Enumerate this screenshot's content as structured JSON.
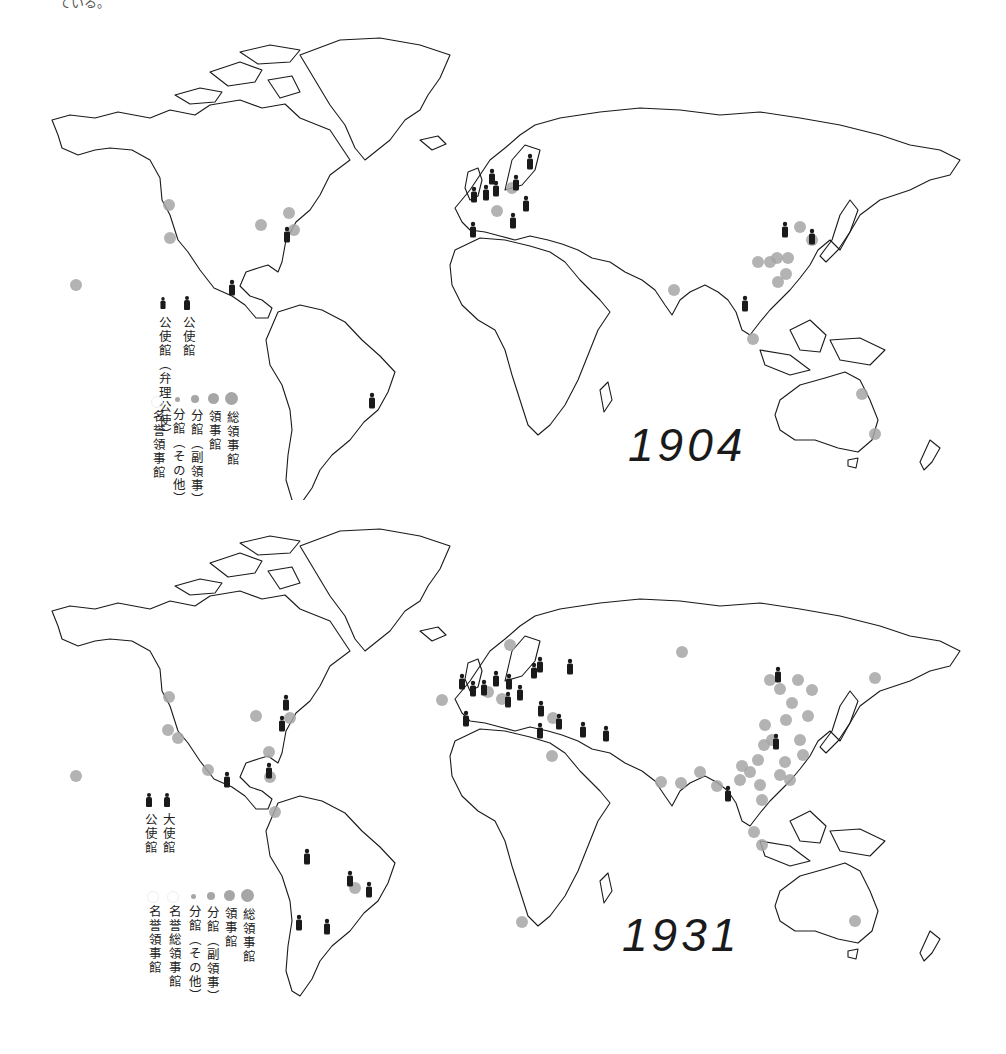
{
  "top_fragment": "ている。",
  "colors": {
    "coastline": "#1a1a1a",
    "consulate_dot": "#a6a6a6",
    "legation_icon": "#1a1a1a",
    "background": "#ffffff"
  },
  "maps": [
    {
      "year": "1904",
      "legend": {
        "people": [
          {
            "label": "公使館",
            "icon": "person-icon"
          },
          {
            "label": "公使館（弁理公使）",
            "icon": "person-icon-small"
          }
        ],
        "dots": [
          {
            "label": "総領事館",
            "size": 13
          },
          {
            "label": "領事館",
            "size": 11
          },
          {
            "label": "分館（副領事）",
            "size": 8
          },
          {
            "label": "分館（その他）",
            "size": 5
          },
          {
            "label": "名誉領事館",
            "size": 0
          }
        ]
      },
      "markers": {
        "legations": [
          [
            232,
            289
          ],
          [
            287,
            236
          ],
          [
            474,
            196
          ],
          [
            486,
            194
          ],
          [
            496,
            190
          ],
          [
            492,
            178
          ],
          [
            516,
            184
          ],
          [
            530,
            163
          ],
          [
            526,
            205
          ],
          [
            473,
            231
          ],
          [
            513,
            222
          ],
          [
            785,
            231
          ],
          [
            812,
            238
          ],
          [
            745,
            305
          ],
          [
            372,
            402
          ]
        ],
        "consulates": [
          [
            169,
            205
          ],
          [
            170,
            238
          ],
          [
            76,
            285
          ],
          [
            261,
            225
          ],
          [
            289,
            213
          ],
          [
            294,
            230
          ],
          [
            497,
            211
          ],
          [
            512,
            188
          ],
          [
            800,
            227
          ],
          [
            812,
            240
          ],
          [
            777,
            258
          ],
          [
            758,
            262
          ],
          [
            770,
            262
          ],
          [
            788,
            258
          ],
          [
            786,
            274
          ],
          [
            778,
            282
          ],
          [
            674,
            290
          ],
          [
            753,
            339
          ],
          [
            862,
            394
          ],
          [
            875,
            434
          ]
        ]
      }
    },
    {
      "year": "1931",
      "legend": {
        "people": [
          {
            "label": "大使館",
            "icon": "person-icon"
          },
          {
            "label": "公使館",
            "icon": "person-icon"
          }
        ],
        "dots": [
          {
            "label": "総領事館",
            "size": 13
          },
          {
            "label": "領事館",
            "size": 11
          },
          {
            "label": "分館（副領事）",
            "size": 8
          },
          {
            "label": "分館（その他）",
            "size": 5
          },
          {
            "label": "名誉総領事館",
            "size": 0
          },
          {
            "label": "名誉領事館",
            "size": 0
          }
        ]
      },
      "markers": {
        "legations": [
          [
            286,
            704
          ],
          [
            282,
            725
          ],
          [
            269,
            772
          ],
          [
            227,
            781
          ],
          [
            462,
            683
          ],
          [
            473,
            690
          ],
          [
            484,
            689
          ],
          [
            496,
            680
          ],
          [
            509,
            683
          ],
          [
            520,
            694
          ],
          [
            534,
            672
          ],
          [
            540,
            666
          ],
          [
            570,
            668
          ],
          [
            508,
            701
          ],
          [
            540,
            732
          ],
          [
            559,
            723
          ],
          [
            583,
            731
          ],
          [
            606,
            735
          ],
          [
            466,
            720
          ],
          [
            541,
            710
          ],
          [
            778,
            676
          ],
          [
            776,
            743
          ],
          [
            728,
            795
          ],
          [
            307,
            858
          ],
          [
            369,
            891
          ],
          [
            299,
            924
          ],
          [
            327,
            928
          ],
          [
            350,
            880
          ]
        ],
        "consulates": [
          [
            169,
            697
          ],
          [
            168,
            730
          ],
          [
            178,
            738
          ],
          [
            208,
            770
          ],
          [
            76,
            776
          ],
          [
            256,
            716
          ],
          [
            290,
            718
          ],
          [
            269,
            752
          ],
          [
            270,
            777
          ],
          [
            275,
            812
          ],
          [
            442,
            700
          ],
          [
            502,
            699
          ],
          [
            553,
            718
          ],
          [
            552,
            756
          ],
          [
            488,
            692
          ],
          [
            510,
            645
          ],
          [
            682,
            652
          ],
          [
            522,
            922
          ],
          [
            661,
            782
          ],
          [
            681,
            783
          ],
          [
            700,
            772
          ],
          [
            717,
            786
          ],
          [
            754,
            832
          ],
          [
            762,
            845
          ],
          [
            855,
            921
          ],
          [
            770,
            680
          ],
          [
            780,
            689
          ],
          [
            798,
            680
          ],
          [
            812,
            690
          ],
          [
            808,
            716
          ],
          [
            792,
            703
          ],
          [
            786,
            720
          ],
          [
            765,
            725
          ],
          [
            772,
            740
          ],
          [
            764,
            745
          ],
          [
            758,
            760
          ],
          [
            750,
            772
          ],
          [
            760,
            785
          ],
          [
            742,
            766
          ],
          [
            740,
            780
          ],
          [
            762,
            800
          ],
          [
            800,
            740
          ],
          [
            803,
            755
          ],
          [
            785,
            762
          ],
          [
            780,
            775
          ],
          [
            790,
            780
          ],
          [
            875,
            678
          ],
          [
            355,
            888
          ]
        ]
      }
    }
  ]
}
